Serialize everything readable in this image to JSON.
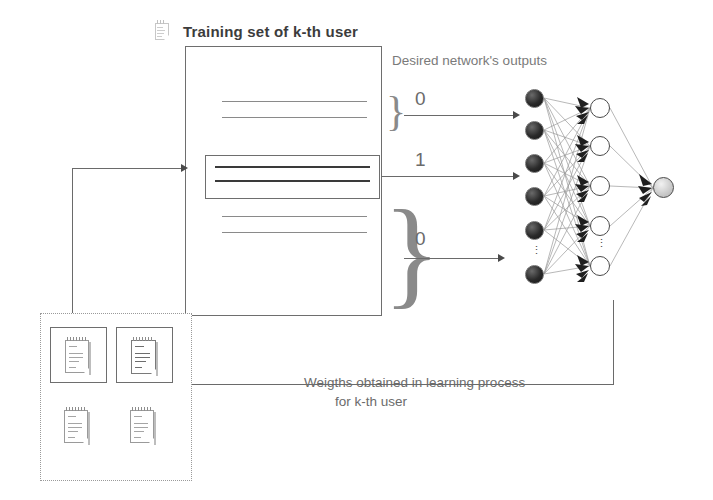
{
  "diagram": {
    "title": "Training set of k-th user",
    "desired_outputs_label": "Desired network's outputs",
    "feedback_caption_line1": "Weigths obtained in learning process",
    "feedback_caption_line2": "for  k-th user",
    "target_labels": [
      "0",
      "1",
      "0"
    ],
    "ellipsis_glyph": "⋮",
    "colors": {
      "stroke": "#6a6a6a",
      "text": "#6b6b6b",
      "title": "#3c3c3c",
      "input_node": "#1a1a1a",
      "hidden_node": "#ffffff",
      "output_node": "#c9c9c9",
      "highlight_border": "#6e6e6e",
      "pool_border": "#9a9a9a"
    },
    "training_set": {
      "pattern_groups": [
        {
          "name": "group-top",
          "lines": 2,
          "emphasis": "normal",
          "target": "0"
        },
        {
          "name": "group-middle",
          "lines": 2,
          "emphasis": "highlight",
          "target": "1"
        },
        {
          "name": "group-bottom",
          "lines": 2,
          "emphasis": "normal",
          "target": "0"
        }
      ]
    },
    "network": {
      "input_layer": {
        "name": "input-layer",
        "visible_nodes": 7,
        "style": "filled-dark",
        "has_ellipsis": true
      },
      "hidden_layer": {
        "name": "hidden-layer",
        "visible_nodes": 5,
        "style": "hollow",
        "has_ellipsis": true
      },
      "output_layer": {
        "name": "output-layer",
        "visible_nodes": 1,
        "style": "filled-light",
        "has_ellipsis": false
      }
    },
    "document_pool": {
      "name": "document-pool",
      "documents": [
        {
          "id": "doc-1",
          "framed": true,
          "emphasis": "normal"
        },
        {
          "id": "doc-2",
          "framed": true,
          "emphasis": "bold"
        },
        {
          "id": "doc-3",
          "framed": false,
          "emphasis": "normal"
        },
        {
          "id": "doc-4",
          "framed": false,
          "emphasis": "normal"
        }
      ]
    }
  }
}
